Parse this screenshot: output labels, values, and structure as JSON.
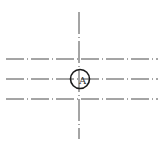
{
  "diagram": {
    "type": "technical-centerline-drawing",
    "colors": {
      "background": "#ffffff",
      "line": "#4a4a4a",
      "circle": "#1a1a1a",
      "label": "#333333"
    },
    "horizontal_lines": [
      {
        "y": 59,
        "x1": 6,
        "x2": 158
      },
      {
        "y": 79,
        "x1": 6,
        "x2": 158
      },
      {
        "y": 99,
        "x1": 6,
        "x2": 158
      }
    ],
    "vertical_line": {
      "x": 79,
      "y1": 12,
      "y2": 139
    },
    "marker": {
      "cx": 80,
      "cy": 79,
      "r": 9.5,
      "label": "A"
    }
  }
}
